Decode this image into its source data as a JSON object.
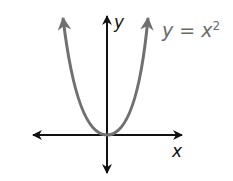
{
  "diagram": {
    "axis_labels": {
      "x": "x",
      "y": "y"
    },
    "curve_label": {
      "lhs": "y",
      "eq": " = ",
      "base": "x",
      "exp": "2"
    },
    "colors": {
      "axis": "#111111",
      "curve": "#707070",
      "label": "#6a6a6a",
      "background": "#ffffff"
    }
  }
}
